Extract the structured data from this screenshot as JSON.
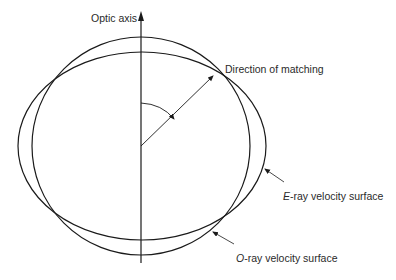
{
  "diagram": {
    "labels": {
      "optic_axis": "Optic axis",
      "direction_of_matching": "Direction of matching",
      "e_ray_prefix": "E",
      "e_ray_rest": "-ray velocity surface",
      "o_ray_prefix": "O",
      "o_ray_rest": "-ray velocity surface"
    },
    "colors": {
      "stroke": "#1a1a1a",
      "text": "#2a2a2a",
      "background": "#ffffff"
    },
    "geometry": {
      "center": [
        141,
        146
      ],
      "o_ray_circle_radius": 109,
      "e_ray_ellipse_radii": [
        124,
        94
      ],
      "optic_axis_top": 14,
      "optic_axis_bottom": 263,
      "matching_point": [
        216,
        73
      ]
    }
  }
}
